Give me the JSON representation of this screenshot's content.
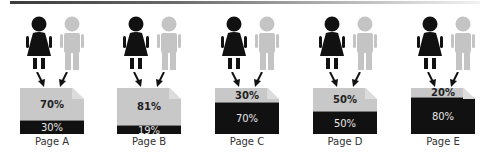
{
  "colors": {
    "figure_dark": "#111111",
    "figure_light": "#c4c4c4",
    "doc_light": "#c8c8c8",
    "doc_dark": "#111111"
  },
  "icons": {
    "female": "female-figure-icon",
    "male": "male-figure-icon",
    "arrow": "arrow-down-icon",
    "document": "document-icon"
  },
  "pages": [
    {
      "label": "Page A",
      "top_pct": "70%",
      "bottom_pct": "30%",
      "top_value": 70,
      "bottom_value": 30
    },
    {
      "label": "Page B",
      "top_pct": "81%",
      "bottom_pct": "19%",
      "top_value": 81,
      "bottom_value": 19
    },
    {
      "label": "Page C",
      "top_pct": "30%",
      "bottom_pct": "70%",
      "top_value": 30,
      "bottom_value": 70
    },
    {
      "label": "Page D",
      "top_pct": "50%",
      "bottom_pct": "50%",
      "top_value": 50,
      "bottom_value": 50
    },
    {
      "label": "Page E",
      "top_pct": "20%",
      "bottom_pct": "80%",
      "top_value": 20,
      "bottom_value": 80
    }
  ]
}
